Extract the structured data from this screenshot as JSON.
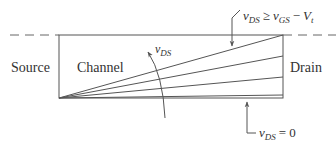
{
  "labels": {
    "source": "Source",
    "channel": "Channel",
    "drain": "Drain"
  },
  "annotations": {
    "top": {
      "var": "v",
      "sub": "DS",
      "op": "≥",
      "var2": "v",
      "sub2": "GS",
      "op2": "−",
      "var3": "V",
      "sub3": "t"
    },
    "bottom": {
      "var": "v",
      "sub": "DS",
      "op": "=",
      "value": "0"
    },
    "sweep": {
      "var": "v",
      "sub": "DS"
    }
  },
  "colors": {
    "stroke": "#555555",
    "text": "#333333"
  },
  "geometry": {
    "channel_rect": {
      "x": 59,
      "y": 35,
      "w": 224,
      "h": 63
    },
    "fan_origin": [
      59,
      98
    ],
    "fan_endpoints_y": [
      35,
      56,
      77,
      95
    ]
  }
}
